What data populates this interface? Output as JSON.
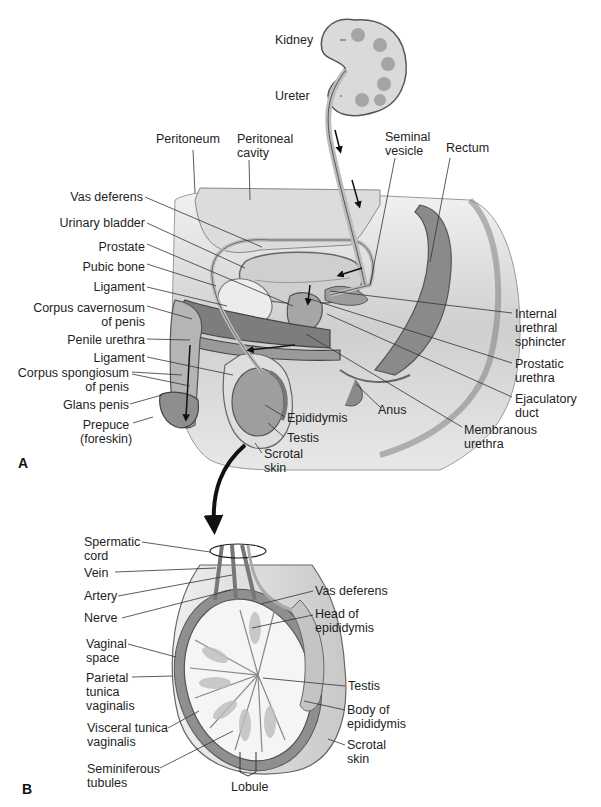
{
  "figure": {
    "panels": [
      {
        "id": "A",
        "label": "A",
        "description": "Sagittal section of male pelvis showing urinary and reproductive tracts",
        "labels": {
          "kidney": "Kidney",
          "ureter": "Ureter",
          "peritoneum": "Peritoneum",
          "peritoneal_cavity": "Peritoneal\ncavity",
          "seminal_vesicle": "Seminal\nvesicle",
          "rectum": "Rectum",
          "vas_deferens": "Vas deferens",
          "urinary_bladder": "Urinary bladder",
          "prostate": "Prostate",
          "pubic_bone": "Pubic bone",
          "ligament_upper": "Ligament",
          "corpus_cavernosum": "Corpus cavernosum\nof penis",
          "penile_urethra": "Penile urethra",
          "ligament_lower": "Ligament",
          "corpus_spongiosum": "Corpus spongiosum\nof penis",
          "glans_penis": "Glans penis",
          "prepuce": "Prepuce\n(foreskin)",
          "epididymis": "Epididymis",
          "testis": "Testis",
          "scrotal_skin": "Scrotal\nskin",
          "anus": "Anus",
          "internal_urethral_sphincter": "Internal\nurethral\nsphincter",
          "prostatic_urethra": "Prostatic\nurethra",
          "ejaculatory_duct": "Ejaculatory\nduct",
          "membranous_urethra": "Membranous\nurethra"
        }
      },
      {
        "id": "B",
        "label": "B",
        "description": "Cross section of testis and scrotum",
        "labels": {
          "spermatic_cord": "Spermatic\ncord",
          "vein": "Vein",
          "artery": "Artery",
          "nerve": "Nerve",
          "vaginal_space": "Vaginal\nspace",
          "parietal_tunica_vaginalis": "Parietal\ntunica\nvaginalis",
          "visceral_tunica_vaginalis": "Visceral tunica\nvaginalis",
          "seminiferous_tubules": "Seminiferous\ntubules",
          "lobule": "Lobule",
          "vas_deferens": "Vas deferens",
          "head_of_epididymis": "Head of\nepididymis",
          "testis": "Testis",
          "body_of_epididymis": "Body of\nepididymis",
          "scrotal_skin": "Scrotal\nskin"
        }
      }
    ],
    "colors": {
      "dark_tissue": "#7a7a7a",
      "mid_tissue": "#a8a8a8",
      "light_tissue": "#d6d6d6",
      "line": "#333333",
      "background": "#ffffff"
    }
  }
}
